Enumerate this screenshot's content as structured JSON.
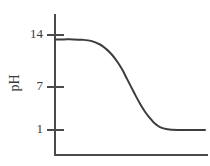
{
  "chart_data": {
    "type": "line",
    "title": "",
    "subtitle": "",
    "xlabel": "",
    "ylabel": "pH",
    "ylim": [
      0,
      15.8
    ],
    "xlim": [
      0,
      100
    ],
    "grid": false,
    "legend": null,
    "y_ticks": [
      {
        "value": 14,
        "label": "14"
      },
      {
        "value": 7,
        "label": "7"
      },
      {
        "value": 1,
        "label": "1"
      }
    ],
    "x_ticks": [],
    "series": [
      {
        "name": "titration-curve",
        "color": "#3d3d3d",
        "x": [
          0,
          6,
          12,
          18,
          24,
          30,
          34,
          38,
          42,
          45,
          48,
          51,
          54,
          57,
          60,
          63,
          66,
          70,
          75,
          82,
          90,
          100
        ],
        "y": [
          13.4,
          13.4,
          13.4,
          13.35,
          13.2,
          12.7,
          12.1,
          11.3,
          10.2,
          9.2,
          8.0,
          6.8,
          5.6,
          4.5,
          3.5,
          2.7,
          2.0,
          1.4,
          1.1,
          1.0,
          1.0,
          1.0
        ]
      }
    ],
    "annotations": []
  },
  "axes": {
    "y_axis_label": "pH",
    "y_tick_labels": [
      "14",
      "7",
      "1"
    ],
    "x_axis_label": ""
  },
  "colors": {
    "background": "#ffffff",
    "axis": "#4a4a4a",
    "curve": "#3d3d3d",
    "text": "#3a3a3a"
  }
}
